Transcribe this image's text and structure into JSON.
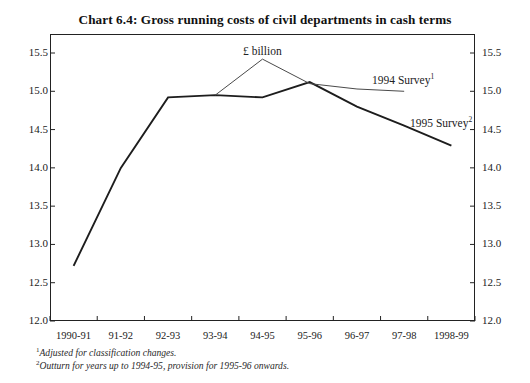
{
  "chart_data": {
    "type": "line",
    "title": "Chart 6.4: Gross running costs of civil departments in cash terms",
    "unit_label": "£ billion",
    "xlabel": "",
    "ylabel": "",
    "grid": false,
    "legend_position": "inline-right",
    "ylim": [
      12.0,
      15.5
    ],
    "ytick_labels": [
      "15.5",
      "15.0",
      "14.5",
      "14.0",
      "13.5",
      "13.0",
      "12.5",
      "12.0"
    ],
    "ytick_values": [
      15.5,
      15.0,
      14.5,
      14.0,
      13.5,
      13.0,
      12.5,
      12.0
    ],
    "axis_mirrored": true,
    "categories": [
      "1990-91",
      "91-92",
      "92-93",
      "93-94",
      "94-95",
      "95-96",
      "96-97",
      "97-98",
      "1998-99"
    ],
    "series": [
      {
        "name": "1995 Survey",
        "name_marker": "2",
        "style": "thick-dark",
        "color": "#1d1d1d",
        "x": [
          "1990-91",
          "91-92",
          "92-93",
          "93-94",
          "94-95",
          "95-96",
          "96-97",
          "97-98",
          "1998-99"
        ],
        "values": [
          12.72,
          14.0,
          14.92,
          14.95,
          14.92,
          15.12,
          14.8,
          14.55,
          14.29
        ]
      },
      {
        "name": "1994 Survey",
        "name_marker": "1",
        "style": "thin-grey",
        "color": "#4a4a4a",
        "x": [
          "93-94",
          "94-95",
          "95-96",
          "96-97",
          "97-98"
        ],
        "values": [
          14.95,
          15.42,
          15.1,
          15.03,
          15.0
        ]
      }
    ],
    "annotations": [
      {
        "text": "1994 Survey",
        "marker": "1",
        "x_px": 372,
        "y_px": 72
      },
      {
        "text": "1995 Survey",
        "marker": "2",
        "x_px": 410,
        "y_px": 115
      },
      {
        "text": "£ billion",
        "marker": "",
        "x_px": 243,
        "y_px": 45
      }
    ]
  },
  "footnotes": [
    {
      "marker": "1",
      "text": "Adjusted for classification changes."
    },
    {
      "marker": "2",
      "text": "Outturn for years up to 1994-95, provision for 1995-96 onwards."
    }
  ]
}
